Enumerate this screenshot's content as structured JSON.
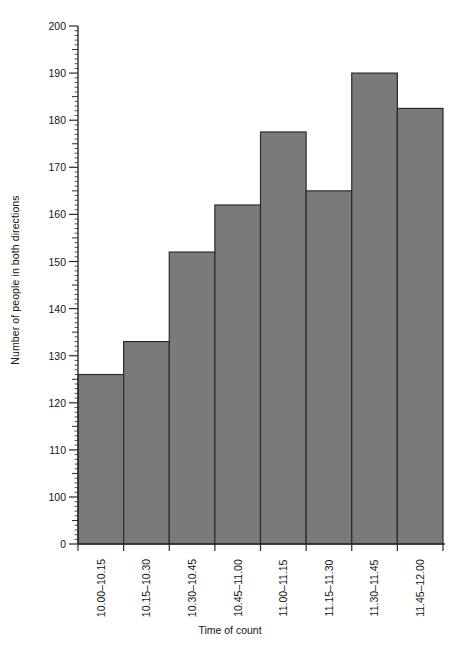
{
  "chart_data": {
    "type": "bar",
    "title": "",
    "subtitle": "",
    "xlabel": "Time of count",
    "ylabel": "Number of people in both directions",
    "categories": [
      "10.00–10.15",
      "10.15–10.30",
      "10.30–10.45",
      "10.45–11.00",
      "11.00–11.15",
      "11.15–11.30",
      "11.30–11.45",
      "11.45–12.00"
    ],
    "values": [
      126,
      133,
      152,
      162,
      177.5,
      165,
      190,
      182.5
    ],
    "ylim": [
      0,
      200
    ],
    "y_axis_break": true,
    "y_axis_break_note": "axis jumps from 0 directly to the 90–200 scaled region",
    "y_tick_labels": [
      "0",
      "100",
      "110",
      "120",
      "130",
      "140",
      "150",
      "160",
      "170",
      "180",
      "190",
      "200"
    ],
    "y_major_tick_step": 10,
    "y_minor_tick_step": 1,
    "grid": false,
    "legend": null,
    "legend_position": "none",
    "bar_fill_color": "#7a7a7a",
    "bar_edge_color": "#2b2b2b",
    "axis_color": "#2b2b2b",
    "background_color": "#ffffff",
    "text_color": "#141414"
  },
  "axis": {
    "y_title": "Number of people in both directions",
    "x_title": "Time of count"
  }
}
